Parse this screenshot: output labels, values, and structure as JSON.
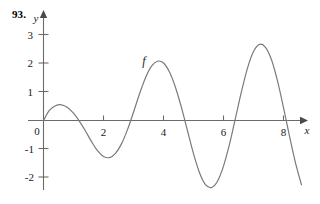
{
  "figure": {
    "problem_number": "93.",
    "curve_label": "f",
    "x_axis_label": "x",
    "y_axis_label": "y",
    "axis_color": "#6b6b6b",
    "curve_color": "#7a7a7a",
    "text_color": "#1a1a1a"
  },
  "chart_data": {
    "type": "line",
    "title": "",
    "xlabel": "x",
    "ylabel": "y",
    "grid": false,
    "legend": "none",
    "xlim": [
      -0.45,
      8.95
    ],
    "ylim": [
      -2.55,
      3.45
    ],
    "xticks": [
      0,
      2,
      4,
      6,
      8
    ],
    "xtick_labels": [
      "0",
      "2",
      "4",
      "6",
      "8"
    ],
    "yticks": [
      -2,
      -1,
      1,
      2,
      3
    ],
    "ytick_labels": [
      "-2",
      "-1",
      "1",
      "2",
      "3"
    ],
    "annotations": [
      {
        "text": "f",
        "x": 3.35,
        "y": 2.1
      }
    ],
    "series": [
      {
        "name": "f",
        "x": [
          0.0,
          0.2,
          0.4,
          0.6,
          0.8,
          1.0,
          1.2,
          1.4,
          1.6,
          1.8,
          2.0,
          2.2,
          2.4,
          2.6,
          2.8,
          3.0,
          3.2,
          3.4,
          3.6,
          3.8,
          4.0,
          4.2,
          4.4,
          4.6,
          4.8,
          5.0,
          5.2,
          5.4,
          5.6,
          5.8,
          6.0,
          6.2,
          6.4,
          6.6,
          6.8,
          7.0,
          7.2,
          7.4,
          7.6,
          7.8,
          8.0,
          8.2,
          8.4,
          8.6
        ],
        "y": [
          0.0,
          0.36,
          0.52,
          0.55,
          0.46,
          0.26,
          -0.03,
          -0.37,
          -0.74,
          -1.06,
          -1.26,
          -1.3,
          -1.15,
          -0.82,
          -0.32,
          0.29,
          0.93,
          1.5,
          1.91,
          2.08,
          2.02,
          1.7,
          1.16,
          0.45,
          -0.36,
          -1.16,
          -1.83,
          -2.25,
          -2.35,
          -2.13,
          -1.6,
          -0.83,
          0.09,
          1.02,
          1.84,
          2.42,
          2.67,
          2.57,
          2.13,
          1.39,
          0.45,
          -0.55,
          -1.49,
          -2.26
        ],
        "local_maxima": [
          {
            "x": 0.6,
            "y": 0.55
          },
          {
            "x": 3.85,
            "y": 2.08
          },
          {
            "x": 7.2,
            "y": 2.67
          }
        ],
        "local_minima": [
          {
            "x": 2.3,
            "y": -1.3
          },
          {
            "x": 5.65,
            "y": -2.37
          }
        ],
        "x_intercepts": [
          0.0,
          1.17,
          2.92,
          4.72,
          6.38,
          8.1
        ]
      }
    ]
  }
}
